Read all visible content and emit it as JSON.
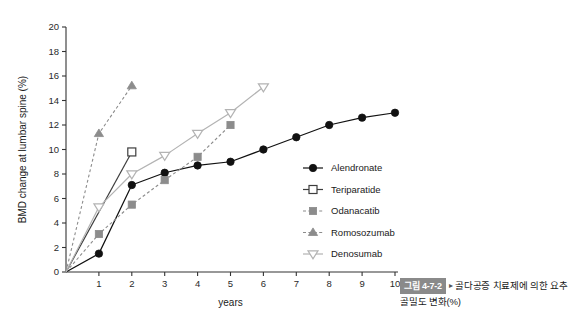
{
  "chart_data": {
    "type": "line",
    "title": "",
    "xlabel": "years",
    "ylabel": "BMD change at lumbar spine (%)",
    "xlim": [
      0,
      10
    ],
    "ylim": [
      0,
      20
    ],
    "xticks": [
      1,
      2,
      3,
      4,
      5,
      6,
      7,
      8,
      9,
      10
    ],
    "yticks": [
      0,
      2,
      4,
      6,
      8,
      10,
      12,
      14,
      16,
      18,
      20
    ],
    "grid": false,
    "legend_position": "right-middle",
    "series": [
      {
        "name": "Alendronate",
        "marker": "filled-circle",
        "line": "solid",
        "color": "#111111",
        "x": [
          0,
          1,
          2,
          3,
          4,
          5,
          6,
          7,
          8,
          9,
          10
        ],
        "values": [
          0,
          1.5,
          7.1,
          8.1,
          8.7,
          9.0,
          10.0,
          11.0,
          12.0,
          12.6,
          13.0
        ]
      },
      {
        "name": "Teriparatide",
        "marker": "open-square",
        "line": "solid",
        "color": "#3d3d3d",
        "x": [
          0,
          2
        ],
        "values": [
          0,
          9.8
        ]
      },
      {
        "name": "Odanacatib",
        "marker": "filled-square",
        "line": "dashed",
        "color": "#8c8c8c",
        "x": [
          0,
          1,
          2,
          3,
          4,
          5
        ],
        "values": [
          0,
          3.1,
          5.5,
          7.5,
          9.4,
          12.0
        ]
      },
      {
        "name": "Romosozumab",
        "marker": "filled-triangle",
        "line": "dashed",
        "color": "#8c8c8c",
        "x": [
          0,
          1,
          2
        ],
        "values": [
          0,
          11.3,
          15.2
        ]
      },
      {
        "name": "Denosumab",
        "marker": "open-down-triangle",
        "line": "solid",
        "color": "#b3b3b3",
        "x": [
          0,
          1,
          2,
          3,
          4,
          5,
          6
        ],
        "values": [
          0,
          5.3,
          8.0,
          9.5,
          11.3,
          13.0,
          15.1
        ]
      }
    ],
    "legend": [
      {
        "label": "Alendronate",
        "marker": "filled-circle",
        "color": "#111111",
        "line": "solid"
      },
      {
        "label": "Teriparatide",
        "marker": "open-square",
        "color": "#3d3d3d",
        "line": "solid"
      },
      {
        "label": "Odanacatib",
        "marker": "filled-square",
        "color": "#8c8c8c",
        "line": "dashed"
      },
      {
        "label": "Romosozumab",
        "marker": "filled-triangle",
        "color": "#8c8c8c",
        "line": "dashed"
      },
      {
        "label": "Denosumab",
        "marker": "open-down-triangle",
        "color": "#b3b3b3",
        "line": "solid"
      }
    ]
  },
  "caption": {
    "badge": "그림 4-7-2",
    "arrow": "▸",
    "text": "골다공증 치료제에 의한 요추골밀도 변화(%)"
  },
  "colors": {
    "axis": "#333333",
    "badge_background": "#8a8a8a",
    "alendronate": "#111111",
    "teriparatide": "#3d3d3d",
    "odanacatib": "#8c8c8c",
    "romosozumab": "#8c8c8c",
    "denosumab": "#b3b3b3"
  }
}
